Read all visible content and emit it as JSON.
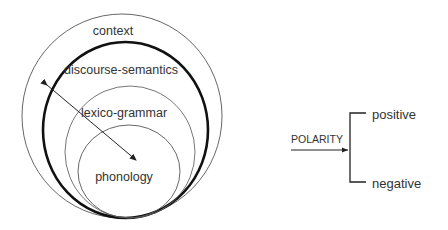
{
  "strata_diagram": {
    "layers": [
      {
        "label": "context",
        "stroke": "#555555",
        "stroke_width": 0.9
      },
      {
        "label": "discourse-semantics",
        "stroke": "#111111",
        "stroke_width": 2.6
      },
      {
        "label": "lexico-grammar",
        "stroke": "#666666",
        "stroke_width": 0.9
      },
      {
        "label": "phonology",
        "stroke": "#555555",
        "stroke_width": 0.9
      }
    ],
    "arrow": {
      "type": "double-headed",
      "color": "#222222"
    }
  },
  "system_network": {
    "system_label": "POLARITY",
    "options": [
      "positive",
      "negative"
    ],
    "color": "#222222"
  }
}
